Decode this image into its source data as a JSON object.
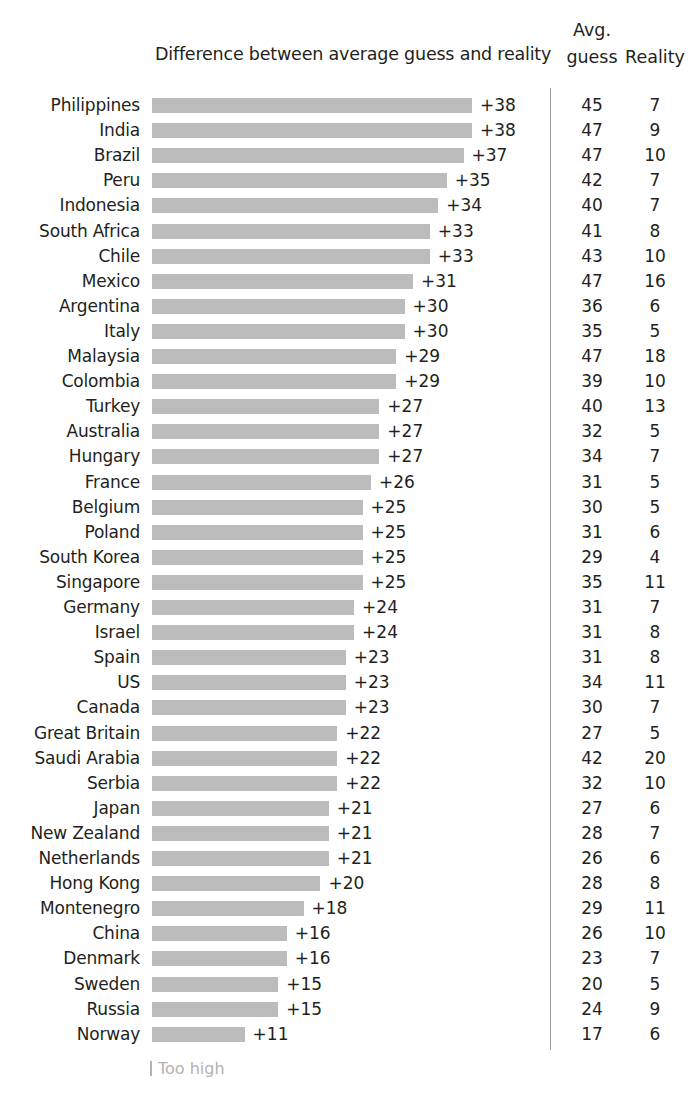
{
  "header": {
    "chart_title": "Difference between average guess and reality",
    "avg_line1": "Avg.",
    "avg_line2": "guess",
    "reality": "Reality"
  },
  "legend": {
    "too_high": "Too high"
  },
  "colors": {
    "bar": "#bcbcbc",
    "text": "#231f20",
    "divider": "#9a9a9a",
    "legend": "#b2b2b2"
  },
  "chart_data": {
    "type": "bar",
    "orientation": "horizontal",
    "title": "Difference between average guess and reality",
    "xlabel": "",
    "ylabel": "",
    "grid": false,
    "legend_position": "bottom-left",
    "legend_entries": [
      "Too high"
    ],
    "columns": [
      "Country",
      "Difference between average guess and reality",
      "Avg. guess",
      "Reality"
    ],
    "xlim": [
      0,
      38
    ],
    "categories": [
      "Philippines",
      "India",
      "Brazil",
      "Peru",
      "Indonesia",
      "South Africa",
      "Chile",
      "Mexico",
      "Argentina",
      "Italy",
      "Malaysia",
      "Colombia",
      "Turkey",
      "Australia",
      "Hungary",
      "France",
      "Belgium",
      "Poland",
      "South Korea",
      "Singapore",
      "Germany",
      "Israel",
      "Spain",
      "US",
      "Canada",
      "Great Britain",
      "Saudi Arabia",
      "Serbia",
      "Japan",
      "New Zealand",
      "Netherlands",
      "Hong Kong",
      "Montenegro",
      "China",
      "Denmark",
      "Sweden",
      "Russia",
      "Norway"
    ],
    "values": [
      38,
      38,
      37,
      35,
      34,
      33,
      33,
      31,
      30,
      30,
      29,
      29,
      27,
      27,
      27,
      26,
      25,
      25,
      25,
      25,
      24,
      24,
      23,
      23,
      23,
      22,
      22,
      22,
      21,
      21,
      21,
      20,
      18,
      16,
      16,
      15,
      15,
      11
    ],
    "series": [
      {
        "name": "Avg. guess",
        "values": [
          45,
          47,
          47,
          42,
          40,
          41,
          43,
          47,
          36,
          35,
          47,
          39,
          40,
          32,
          34,
          31,
          30,
          31,
          29,
          35,
          31,
          31,
          31,
          34,
          30,
          27,
          42,
          32,
          27,
          28,
          26,
          28,
          29,
          26,
          23,
          20,
          24,
          17
        ]
      },
      {
        "name": "Reality",
        "values": [
          7,
          9,
          10,
          7,
          7,
          8,
          10,
          16,
          6,
          5,
          18,
          10,
          13,
          5,
          7,
          5,
          5,
          6,
          4,
          11,
          7,
          8,
          8,
          11,
          7,
          5,
          20,
          10,
          6,
          7,
          6,
          8,
          11,
          10,
          7,
          5,
          9,
          6
        ]
      }
    ]
  },
  "rows": [
    {
      "country": "Philippines",
      "diff": "+38",
      "value": 38,
      "guess": "45",
      "reality": "7"
    },
    {
      "country": "India",
      "diff": "+38",
      "value": 38,
      "guess": "47",
      "reality": "9"
    },
    {
      "country": "Brazil",
      "diff": "+37",
      "value": 37,
      "guess": "47",
      "reality": "10"
    },
    {
      "country": "Peru",
      "diff": "+35",
      "value": 35,
      "guess": "42",
      "reality": "7"
    },
    {
      "country": "Indonesia",
      "diff": "+34",
      "value": 34,
      "guess": "40",
      "reality": "7"
    },
    {
      "country": "South Africa",
      "diff": "+33",
      "value": 33,
      "guess": "41",
      "reality": "8"
    },
    {
      "country": "Chile",
      "diff": "+33",
      "value": 33,
      "guess": "43",
      "reality": "10"
    },
    {
      "country": "Mexico",
      "diff": "+31",
      "value": 31,
      "guess": "47",
      "reality": "16"
    },
    {
      "country": "Argentina",
      "diff": "+30",
      "value": 30,
      "guess": "36",
      "reality": "6"
    },
    {
      "country": "Italy",
      "diff": "+30",
      "value": 30,
      "guess": "35",
      "reality": "5"
    },
    {
      "country": "Malaysia",
      "diff": "+29",
      "value": 29,
      "guess": "47",
      "reality": "18"
    },
    {
      "country": "Colombia",
      "diff": "+29",
      "value": 29,
      "guess": "39",
      "reality": "10"
    },
    {
      "country": "Turkey",
      "diff": "+27",
      "value": 27,
      "guess": "40",
      "reality": "13"
    },
    {
      "country": "Australia",
      "diff": "+27",
      "value": 27,
      "guess": "32",
      "reality": "5"
    },
    {
      "country": "Hungary",
      "diff": "+27",
      "value": 27,
      "guess": "34",
      "reality": "7"
    },
    {
      "country": "France",
      "diff": "+26",
      "value": 26,
      "guess": "31",
      "reality": "5"
    },
    {
      "country": "Belgium",
      "diff": "+25",
      "value": 25,
      "guess": "30",
      "reality": "5"
    },
    {
      "country": "Poland",
      "diff": "+25",
      "value": 25,
      "guess": "31",
      "reality": "6"
    },
    {
      "country": "South Korea",
      "diff": "+25",
      "value": 25,
      "guess": "29",
      "reality": "4"
    },
    {
      "country": "Singapore",
      "diff": "+25",
      "value": 25,
      "guess": "35",
      "reality": "11"
    },
    {
      "country": "Germany",
      "diff": "+24",
      "value": 24,
      "guess": "31",
      "reality": "7"
    },
    {
      "country": "Israel",
      "diff": "+24",
      "value": 24,
      "guess": "31",
      "reality": "8"
    },
    {
      "country": "Spain",
      "diff": "+23",
      "value": 23,
      "guess": "31",
      "reality": "8"
    },
    {
      "country": "US",
      "diff": "+23",
      "value": 23,
      "guess": "34",
      "reality": "11"
    },
    {
      "country": "Canada",
      "diff": "+23",
      "value": 23,
      "guess": "30",
      "reality": "7"
    },
    {
      "country": "Great Britain",
      "diff": "+22",
      "value": 22,
      "guess": "27",
      "reality": "5"
    },
    {
      "country": "Saudi Arabia",
      "diff": "+22",
      "value": 22,
      "guess": "42",
      "reality": "20"
    },
    {
      "country": "Serbia",
      "diff": "+22",
      "value": 22,
      "guess": "32",
      "reality": "10"
    },
    {
      "country": "Japan",
      "diff": "+21",
      "value": 21,
      "guess": "27",
      "reality": "6"
    },
    {
      "country": "New Zealand",
      "diff": "+21",
      "value": 21,
      "guess": "28",
      "reality": "7"
    },
    {
      "country": "Netherlands",
      "diff": "+21",
      "value": 21,
      "guess": "26",
      "reality": "6"
    },
    {
      "country": "Hong Kong",
      "diff": "+20",
      "value": 20,
      "guess": "28",
      "reality": "8"
    },
    {
      "country": "Montenegro",
      "diff": "+18",
      "value": 18,
      "guess": "29",
      "reality": "11"
    },
    {
      "country": "China",
      "diff": "+16",
      "value": 16,
      "guess": "26",
      "reality": "10"
    },
    {
      "country": "Denmark",
      "diff": "+16",
      "value": 16,
      "guess": "23",
      "reality": "7"
    },
    {
      "country": "Sweden",
      "diff": "+15",
      "value": 15,
      "guess": "20",
      "reality": "5"
    },
    {
      "country": "Russia",
      "diff": "+15",
      "value": 15,
      "guess": "24",
      "reality": "9"
    },
    {
      "country": "Norway",
      "diff": "+11",
      "value": 11,
      "guess": "17",
      "reality": "6"
    }
  ]
}
